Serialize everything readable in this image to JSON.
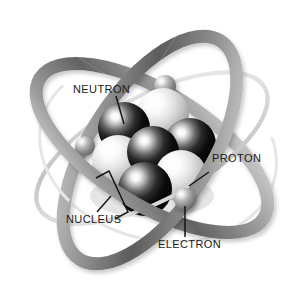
{
  "diagram": {
    "background_color": "#ffffff",
    "labels": {
      "neutron": "NEUTRON",
      "proton": "PROTON",
      "nucleus": "NUCLEUS",
      "electron": "ELECTRON"
    },
    "label_color": "#1b1b1b",
    "leader_line_color": "#151515",
    "orbits": [
      {
        "name": "orbit-thick-front",
        "style": "thick-gray-band",
        "color_dark": "#575757",
        "color_light": "#c9c9c9"
      },
      {
        "name": "orbit-thick-back",
        "style": "thick-gray-band",
        "color_dark": "#6e6e6e",
        "color_light": "#d4d4d4"
      },
      {
        "name": "orbit-thin-light",
        "style": "thin-light-ring",
        "color_dark": "#b9b9b9",
        "color_light": "#ededed"
      }
    ],
    "electrons": [
      {
        "name": "electron-top",
        "cx": 165,
        "cy": 86,
        "r": 11
      },
      {
        "name": "electron-left",
        "cx": 85,
        "cy": 146,
        "r": 10
      },
      {
        "name": "electron-bottom-right",
        "cx": 185,
        "cy": 199,
        "r": 11
      }
    ],
    "electron_color_light": "#e8e8e8",
    "electron_color_dark": "#6b6b6b",
    "nucleus_particles": [
      {
        "name": "proton-top",
        "type": "proton",
        "cx": 163,
        "cy": 114,
        "r": 26
      },
      {
        "name": "neutron-upper-left",
        "type": "neutron",
        "cx": 124,
        "cy": 128,
        "r": 26
      },
      {
        "name": "proton-left",
        "type": "proton",
        "cx": 118,
        "cy": 161,
        "r": 26
      },
      {
        "name": "neutron-center",
        "type": "neutron",
        "cx": 153,
        "cy": 152,
        "r": 26
      },
      {
        "name": "neutron-right",
        "type": "neutron",
        "cx": 190,
        "cy": 144,
        "r": 26
      },
      {
        "name": "proton-right",
        "type": "proton",
        "cx": 181,
        "cy": 176,
        "r": 26
      },
      {
        "name": "neutron-bottom",
        "type": "neutron",
        "cx": 145,
        "cy": 189,
        "r": 27
      }
    ],
    "neutron_color_dark": "#070707",
    "neutron_color_light": "#f2f2f2",
    "proton_color_dark": "#9d9d9d",
    "proton_color_light": "#ffffff"
  }
}
